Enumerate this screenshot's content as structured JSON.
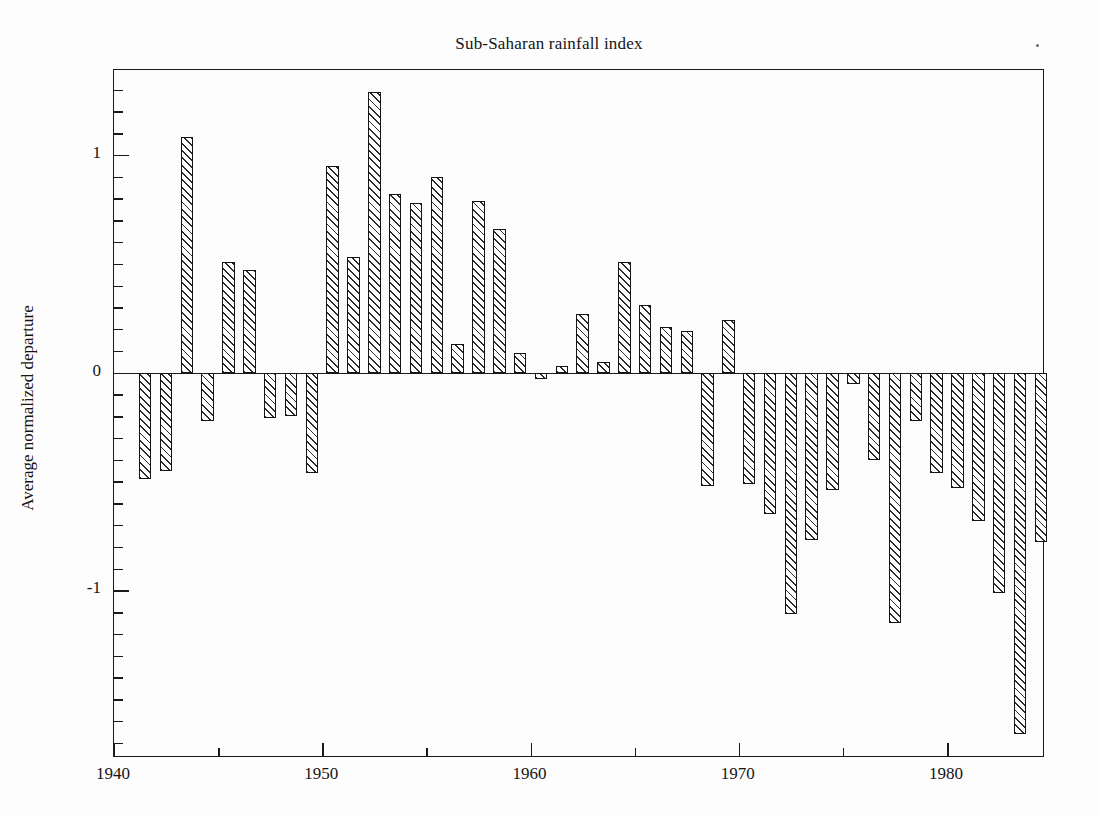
{
  "chart_data": {
    "type": "bar",
    "title": "Sub-Saharan rainfall index",
    "xlabel": "",
    "ylabel": "Average normalized departure",
    "xlim": [
      1940,
      1984.7
    ],
    "ylim": [
      -1.77,
      1.39
    ],
    "grid": false,
    "legend": null,
    "x_major_ticks": [
      1940,
      1950,
      1960,
      1970,
      1980
    ],
    "x_minor_ticks": [
      1945,
      1955,
      1965,
      1975
    ],
    "y_major_ticks": [
      1,
      0,
      -1
    ],
    "y_major_tick_labels": [
      "1",
      "0",
      "-1"
    ],
    "y_minor_tick_step": 0.1,
    "bar_style": {
      "fill": "diagonal-hatch",
      "edge_color": "#141414",
      "hatch_color": "#2b2b2b",
      "face_color": "#ffffff"
    },
    "categories": [
      1941,
      1942,
      1943,
      1944,
      1945,
      1946,
      1947,
      1948,
      1949,
      1950,
      1951,
      1952,
      1953,
      1954,
      1955,
      1956,
      1957,
      1958,
      1959,
      1960,
      1961,
      1962,
      1963,
      1964,
      1965,
      1966,
      1967,
      1968,
      1969,
      1970,
      1971,
      1972,
      1973,
      1974,
      1975,
      1976,
      1977,
      1978,
      1979,
      1980,
      1981,
      1982,
      1983,
      1984
    ],
    "values": [
      -0.49,
      -0.45,
      1.08,
      -0.22,
      0.51,
      0.47,
      -0.21,
      -0.2,
      -0.46,
      0.95,
      0.53,
      1.29,
      0.82,
      0.78,
      0.9,
      0.13,
      0.79,
      0.66,
      0.09,
      -0.03,
      0.03,
      0.27,
      0.05,
      0.51,
      0.31,
      0.21,
      0.19,
      -0.52,
      0.24,
      -0.51,
      -0.65,
      -1.11,
      -0.77,
      -0.54,
      -0.05,
      -0.4,
      -1.15,
      -0.22,
      -0.46,
      -0.53,
      -0.68,
      -1.01,
      -1.66,
      -0.78
    ]
  },
  "figure": {
    "title": "Sub-Saharan rainfall index",
    "y_axis_title": "Average normalized departure"
  }
}
